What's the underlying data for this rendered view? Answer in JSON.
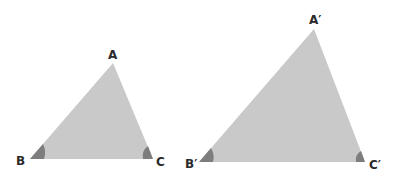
{
  "diagram": {
    "colors": {
      "fill": "#c9c9c9",
      "angle_mark": "#7d7d7d",
      "label": "#2a2a2a"
    },
    "triangles": [
      {
        "name": "ABC",
        "vertices": {
          "A": [
            113,
            63
          ],
          "B": [
            30,
            159
          ],
          "C": [
            153,
            159
          ]
        },
        "labels": {
          "A": "A",
          "B": "B",
          "C": "C"
        }
      },
      {
        "name": "A'B'C'",
        "vertices": {
          "A": [
            314,
            29
          ],
          "B": [
            199,
            162
          ],
          "C": [
            365,
            162
          ]
        },
        "labels": {
          "A": "A′",
          "B": "B′",
          "C": "C′"
        }
      }
    ],
    "angle_marks": [
      "B",
      "C",
      "B′",
      "C′"
    ]
  }
}
